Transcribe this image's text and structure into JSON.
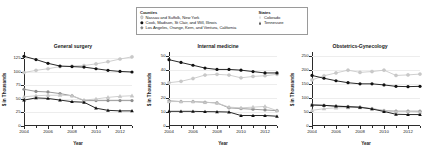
{
  "legend": {
    "counties_heading": "Counties",
    "states_heading": "States",
    "counties": [
      {
        "label": "Nassau and Suffolk, New York",
        "marker": "circle-light",
        "color": "#c9c9c9"
      },
      {
        "label": "Cook, Madison, St Clair, and Will, Illinois",
        "marker": "circle-filled",
        "color": "#111111"
      },
      {
        "label": "Los Angeles, Orange, Kern, and Ventura, California",
        "marker": "circle-gray",
        "color": "#8e8e8e"
      }
    ],
    "states": [
      {
        "label": "Colorado",
        "marker": "triangle-light",
        "color": "#c9c9c9"
      },
      {
        "label": "Tennessee",
        "marker": "triangle-filled",
        "color": "#111111"
      }
    ]
  },
  "axis": {
    "x_title": "Year",
    "y_title": "$ in Thousands"
  },
  "chart_data": [
    {
      "type": "line",
      "title": "General surgery",
      "xlabel": "Year",
      "ylabel": "$ in Thousands",
      "x": [
        2004,
        2005,
        2006,
        2007,
        2008,
        2009,
        2010,
        2011,
        2012,
        2013
      ],
      "xticks": [
        2004,
        2006,
        2008,
        2010,
        2012
      ],
      "ylim": [
        0,
        137
      ],
      "yticks": [
        0,
        25,
        50,
        75,
        100,
        125
      ],
      "grid": true,
      "legend_position": "top-shared",
      "series": [
        {
          "name": "Nassau and Suffolk, New York",
          "marker": "circle-light",
          "color": "#c9c9c9",
          "values": [
            99,
            103,
            106,
            110,
            111,
            112,
            115,
            119,
            124,
            128
          ]
        },
        {
          "name": "Cook, Madison, St Clair, and Will, Illinois",
          "marker": "circle-filled",
          "color": "#111111",
          "values": [
            129,
            123,
            116,
            111,
            110,
            109,
            106,
            103,
            101,
            100
          ]
        },
        {
          "name": "Los Angeles, Orange, Kern, and Ventura, California",
          "marker": "circle-gray",
          "color": "#8e8e8e",
          "values": [
            68,
            64,
            63,
            60,
            56,
            47,
            47,
            47,
            47,
            47
          ]
        },
        {
          "name": "Colorado",
          "marker": "triangle-light",
          "color": "#c9c9c9",
          "values": [
            54,
            56,
            57,
            57,
            56,
            48,
            50,
            53,
            55,
            56
          ]
        },
        {
          "name": "Tennessee",
          "marker": "triangle-filled",
          "color": "#111111",
          "values": [
            48,
            52,
            51,
            48,
            45,
            44,
            33,
            29,
            28,
            28
          ]
        }
      ]
    },
    {
      "type": "line",
      "title": "Internal medicine",
      "xlabel": "Year",
      "ylabel": "$ in Thousands",
      "x": [
        2004,
        2005,
        2006,
        2007,
        2008,
        2009,
        2010,
        2011,
        2012,
        2013
      ],
      "xticks": [
        2004,
        2006,
        2008,
        2010,
        2012
      ],
      "ylim": [
        0,
        53
      ],
      "yticks": [
        0,
        10,
        20,
        30,
        40,
        50
      ],
      "grid": true,
      "legend_position": "top-shared",
      "series": [
        {
          "name": "Nassau and Suffolk, New York",
          "marker": "circle-light",
          "color": "#c9c9c9",
          "values": [
            31,
            32,
            34,
            36.5,
            37,
            36.5,
            34.5,
            35.5,
            36,
            37
          ]
        },
        {
          "name": "Cook, Madison, St Clair, and Will, Illinois",
          "marker": "circle-filled",
          "color": "#111111",
          "values": [
            47.5,
            45.5,
            43.5,
            41.5,
            40.5,
            40.5,
            40,
            39,
            38,
            38
          ]
        },
        {
          "name": "Los Angeles, Orange, Kern, and Ventura, California",
          "marker": "circle-gray",
          "color": "#8e8e8e",
          "values": [
            18,
            17.5,
            17.5,
            17,
            16.5,
            13,
            12.5,
            12,
            11.5,
            11
          ]
        },
        {
          "name": "Colorado",
          "marker": "triangle-light",
          "color": "#c9c9c9",
          "values": [
            17.5,
            17.5,
            17.5,
            17,
            16.5,
            13.5,
            13,
            13.5,
            14,
            11
          ]
        },
        {
          "name": "Tennessee",
          "marker": "triangle-filled",
          "color": "#111111",
          "values": [
            10.5,
            10.5,
            10.5,
            10.3,
            10.2,
            10,
            7.5,
            7.5,
            7.5,
            7
          ]
        }
      ]
    },
    {
      "type": "line",
      "title": "Obstetrics-Gynecology",
      "xlabel": "Year",
      "ylabel": "$ in Thousands",
      "x": [
        2004,
        2005,
        2006,
        2007,
        2008,
        2009,
        2010,
        2011,
        2012,
        2013
      ],
      "xticks": [
        2004,
        2006,
        2008,
        2010,
        2012
      ],
      "ylim": [
        0,
        265
      ],
      "yticks": [
        0,
        50,
        100,
        150,
        200,
        250
      ],
      "grid": true,
      "legend_position": "top-shared",
      "series": [
        {
          "name": "Nassau and Suffolk, New York",
          "marker": "circle-light",
          "color": "#c9c9c9",
          "values": [
            165,
            180,
            190,
            200,
            192,
            195,
            200,
            181,
            183,
            186
          ]
        },
        {
          "name": "Cook, Madison, St Clair, and Will, Illinois",
          "marker": "circle-filled",
          "color": "#111111",
          "values": [
            181,
            171,
            162,
            155,
            151,
            151,
            147,
            142,
            141,
            142
          ]
        },
        {
          "name": "Los Angeles, Orange, Kern, and Ventura, California",
          "marker": "circle-gray",
          "color": "#8e8e8e",
          "values": [
            76,
            74,
            71,
            70,
            68,
            62,
            55,
            53,
            53,
            53
          ]
        },
        {
          "name": "Colorado",
          "marker": "triangle-light",
          "color": "#c9c9c9",
          "values": [
            56,
            62,
            65,
            66,
            66,
            62,
            55,
            52,
            52,
            50
          ]
        },
        {
          "name": "Tennessee",
          "marker": "triangle-filled",
          "color": "#111111",
          "values": [
            75,
            74,
            71,
            69,
            67,
            61,
            52,
            42,
            41,
            41
          ]
        }
      ]
    }
  ]
}
